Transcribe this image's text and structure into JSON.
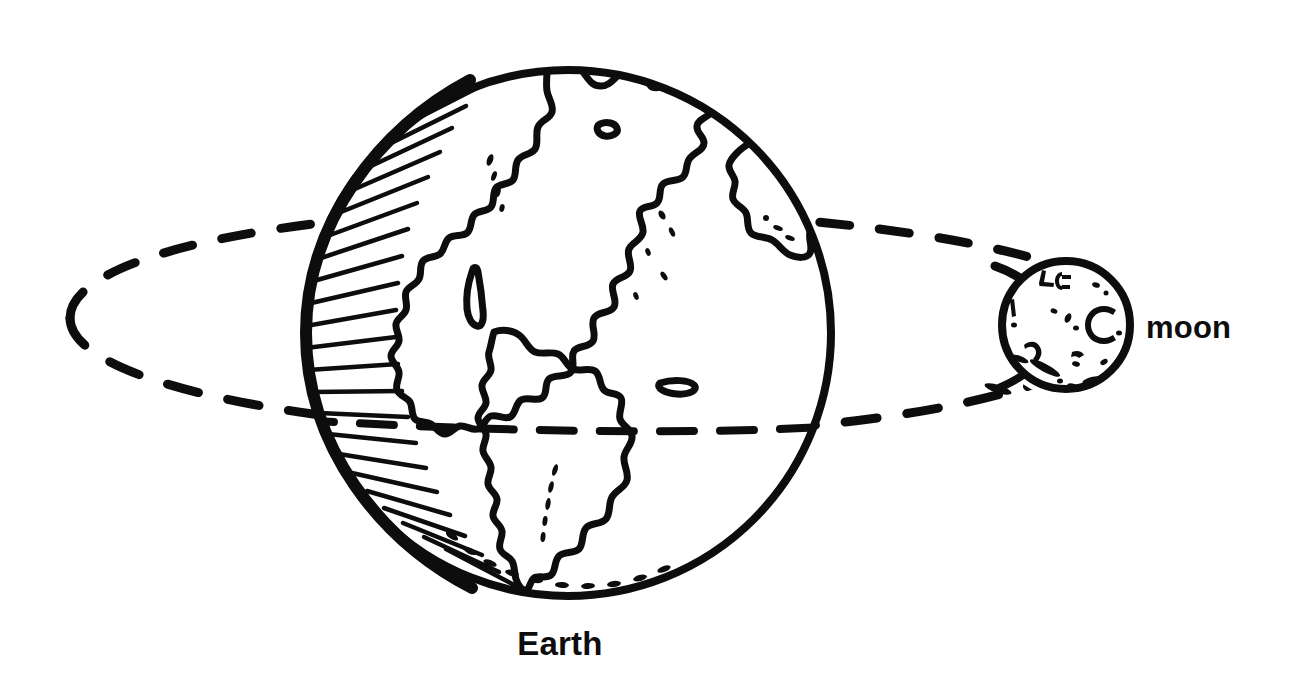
{
  "diagram": {
    "style": "black and white line drawing",
    "background_color": "#ffffff",
    "ink_color": "#0d0d0d",
    "labels": {
      "earth": "Earth",
      "moon": "moon"
    },
    "earth": {
      "name": "Earth",
      "center_x": 568,
      "center_y": 333,
      "radius": 268,
      "outline_width": 7,
      "shading_side": "left",
      "features": [
        "north-america",
        "greenland",
        "south-america",
        "baja-california",
        "caribbean-island",
        "west-africa-europe-sliver",
        "equator-dashed-line",
        "antarctica-dots"
      ]
    },
    "moon": {
      "name": "moon",
      "center_x": 1066,
      "center_y": 325,
      "radius": 69,
      "outline_width": 7,
      "crater_count": 18
    },
    "orbit": {
      "name": "moon orbit",
      "style": "dashed ellipse",
      "center_x": 600,
      "center_y": 322,
      "semi_major_x": 532,
      "semi_minor_y": 112,
      "dash_count": 26,
      "stroke_width": 9
    },
    "equator": {
      "name": "equator",
      "style": "dashed line",
      "y": 428,
      "dash_count": 14
    }
  }
}
